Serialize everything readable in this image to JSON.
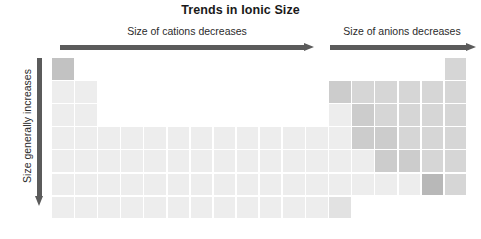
{
  "figure": {
    "title": "Trends in Ionic Size",
    "type": "periodic-table-trend-diagram"
  },
  "labels": {
    "cations": "Size of cations decreases",
    "anions": "Size of anions decreases",
    "vertical": "Size generally increases"
  },
  "arrows": {
    "cations_direction": "right",
    "anions_direction": "right",
    "vertical_direction": "down",
    "color": "#5b5b5b"
  },
  "colors": {
    "base_cell": "#f2f2f2",
    "light": "#ededed",
    "mid_light": "#e2e2e2",
    "mid": "#d6d6d6",
    "mid_dark": "#cccccc",
    "dark": "#c2c2c2",
    "darkest": "#b8b8b8",
    "text": "#2b2b2b",
    "title": "#1a1a1a",
    "background": "#ffffff"
  },
  "chart_data": {
    "type": "heatmap",
    "title": "Trends in Ionic Size",
    "xlabel": "",
    "ylabel": "",
    "grid": true,
    "legend": "none",
    "cell_size_px": 21.5,
    "grid_origin": {
      "x": 52,
      "y": 58
    },
    "cells": [
      {
        "row": 1,
        "col": 1,
        "shade": "dark"
      },
      {
        "row": 1,
        "col": 18,
        "shade": "mid"
      },
      {
        "row": 2,
        "col": 1,
        "shade": "light"
      },
      {
        "row": 2,
        "col": 2,
        "shade": "light"
      },
      {
        "row": 2,
        "col": 13,
        "shade": "mid_dark"
      },
      {
        "row": 2,
        "col": 14,
        "shade": "mid"
      },
      {
        "row": 2,
        "col": 15,
        "shade": "mid"
      },
      {
        "row": 2,
        "col": 16,
        "shade": "mid"
      },
      {
        "row": 2,
        "col": 17,
        "shade": "mid"
      },
      {
        "row": 2,
        "col": 18,
        "shade": "mid"
      },
      {
        "row": 3,
        "col": 1,
        "shade": "light"
      },
      {
        "row": 3,
        "col": 2,
        "shade": "light"
      },
      {
        "row": 3,
        "col": 13,
        "shade": "light"
      },
      {
        "row": 3,
        "col": 14,
        "shade": "mid_dark"
      },
      {
        "row": 3,
        "col": 15,
        "shade": "mid"
      },
      {
        "row": 3,
        "col": 16,
        "shade": "mid"
      },
      {
        "row": 3,
        "col": 17,
        "shade": "mid"
      },
      {
        "row": 3,
        "col": 18,
        "shade": "mid"
      },
      {
        "row": 4,
        "col": 1,
        "shade": "light"
      },
      {
        "row": 4,
        "col": 2,
        "shade": "light"
      },
      {
        "row": 4,
        "col": 3,
        "shade": "light"
      },
      {
        "row": 4,
        "col": 4,
        "shade": "light"
      },
      {
        "row": 4,
        "col": 5,
        "shade": "light"
      },
      {
        "row": 4,
        "col": 6,
        "shade": "light"
      },
      {
        "row": 4,
        "col": 7,
        "shade": "light"
      },
      {
        "row": 4,
        "col": 8,
        "shade": "light"
      },
      {
        "row": 4,
        "col": 9,
        "shade": "light"
      },
      {
        "row": 4,
        "col": 10,
        "shade": "light"
      },
      {
        "row": 4,
        "col": 11,
        "shade": "light"
      },
      {
        "row": 4,
        "col": 12,
        "shade": "light"
      },
      {
        "row": 4,
        "col": 13,
        "shade": "light"
      },
      {
        "row": 4,
        "col": 14,
        "shade": "mid_dark"
      },
      {
        "row": 4,
        "col": 15,
        "shade": "mid_dark"
      },
      {
        "row": 4,
        "col": 16,
        "shade": "mid"
      },
      {
        "row": 4,
        "col": 17,
        "shade": "mid"
      },
      {
        "row": 4,
        "col": 18,
        "shade": "mid"
      },
      {
        "row": 5,
        "col": 1,
        "shade": "light"
      },
      {
        "row": 5,
        "col": 2,
        "shade": "light"
      },
      {
        "row": 5,
        "col": 3,
        "shade": "light"
      },
      {
        "row": 5,
        "col": 4,
        "shade": "light"
      },
      {
        "row": 5,
        "col": 5,
        "shade": "light"
      },
      {
        "row": 5,
        "col": 6,
        "shade": "light"
      },
      {
        "row": 5,
        "col": 7,
        "shade": "light"
      },
      {
        "row": 5,
        "col": 8,
        "shade": "light"
      },
      {
        "row": 5,
        "col": 9,
        "shade": "light"
      },
      {
        "row": 5,
        "col": 10,
        "shade": "light"
      },
      {
        "row": 5,
        "col": 11,
        "shade": "light"
      },
      {
        "row": 5,
        "col": 12,
        "shade": "light"
      },
      {
        "row": 5,
        "col": 13,
        "shade": "light"
      },
      {
        "row": 5,
        "col": 14,
        "shade": "light"
      },
      {
        "row": 5,
        "col": 15,
        "shade": "mid_dark"
      },
      {
        "row": 5,
        "col": 16,
        "shade": "mid_dark"
      },
      {
        "row": 5,
        "col": 17,
        "shade": "mid"
      },
      {
        "row": 5,
        "col": 18,
        "shade": "mid"
      },
      {
        "row": 6,
        "col": 1,
        "shade": "light"
      },
      {
        "row": 6,
        "col": 2,
        "shade": "light"
      },
      {
        "row": 6,
        "col": 3,
        "shade": "light"
      },
      {
        "row": 6,
        "col": 4,
        "shade": "light"
      },
      {
        "row": 6,
        "col": 5,
        "shade": "light"
      },
      {
        "row": 6,
        "col": 6,
        "shade": "light"
      },
      {
        "row": 6,
        "col": 7,
        "shade": "light"
      },
      {
        "row": 6,
        "col": 8,
        "shade": "light"
      },
      {
        "row": 6,
        "col": 9,
        "shade": "light"
      },
      {
        "row": 6,
        "col": 10,
        "shade": "light"
      },
      {
        "row": 6,
        "col": 11,
        "shade": "light"
      },
      {
        "row": 6,
        "col": 12,
        "shade": "light"
      },
      {
        "row": 6,
        "col": 13,
        "shade": "light"
      },
      {
        "row": 6,
        "col": 14,
        "shade": "light"
      },
      {
        "row": 6,
        "col": 15,
        "shade": "light"
      },
      {
        "row": 6,
        "col": 16,
        "shade": "light"
      },
      {
        "row": 6,
        "col": 17,
        "shade": "darkest"
      },
      {
        "row": 6,
        "col": 18,
        "shade": "mid"
      },
      {
        "row": 7,
        "col": 1,
        "shade": "light"
      },
      {
        "row": 7,
        "col": 2,
        "shade": "light"
      },
      {
        "row": 7,
        "col": 3,
        "shade": "light"
      },
      {
        "row": 7,
        "col": 4,
        "shade": "light"
      },
      {
        "row": 7,
        "col": 5,
        "shade": "light"
      },
      {
        "row": 7,
        "col": 6,
        "shade": "light"
      },
      {
        "row": 7,
        "col": 7,
        "shade": "light"
      },
      {
        "row": 7,
        "col": 8,
        "shade": "light"
      },
      {
        "row": 7,
        "col": 9,
        "shade": "light"
      },
      {
        "row": 7,
        "col": 10,
        "shade": "light"
      },
      {
        "row": 7,
        "col": 11,
        "shade": "light"
      },
      {
        "row": 7,
        "col": 12,
        "shade": "light"
      },
      {
        "row": 7,
        "col": 13,
        "shade": "mid_light"
      }
    ]
  }
}
